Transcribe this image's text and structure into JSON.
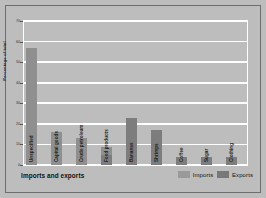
{
  "chart_data": {
    "type": "bar",
    "title": "Imports and exports",
    "xlabel": "",
    "ylabel": "Percentage of total",
    "ylim": [
      0,
      70
    ],
    "yticks": [
      0,
      10,
      20,
      30,
      40,
      50,
      60,
      70
    ],
    "grid": true,
    "legend_position": "bottom-right",
    "categories": [
      "Unspecified",
      "Capital goods",
      "Crude petroleum",
      "Food products",
      "Bananas",
      "Shrimps",
      "Coffee",
      "Sugar",
      "Clothing"
    ],
    "series": [
      {
        "name": "Imports",
        "color": "#8f8f8f",
        "values": [
          57,
          16,
          13,
          9,
          null,
          null,
          null,
          null,
          null
        ]
      },
      {
        "name": "Exports",
        "color": "#7d7d7d",
        "values": [
          null,
          null,
          null,
          5,
          23,
          17,
          4,
          4,
          4
        ]
      }
    ]
  },
  "axis": {
    "y_title": "Percentage of total",
    "tick_labels": [
      "70",
      "60",
      "50",
      "40",
      "30",
      "20",
      "10",
      "0"
    ]
  },
  "legend": {
    "imports_label": "Imports",
    "exports_label": "Exports"
  },
  "footer": {
    "title": "Imports and exports"
  }
}
